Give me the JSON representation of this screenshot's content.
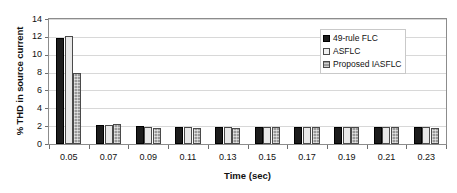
{
  "chart_data": {
    "type": "bar",
    "title": "",
    "xlabel": "Time (sec)",
    "ylabel": "% THD in source current",
    "categories": [
      "0.05",
      "0.07",
      "0.09",
      "0.11",
      "0.13",
      "0.15",
      "0.17",
      "0.19",
      "0.21",
      "0.23"
    ],
    "series": [
      {
        "name": "49-rule FLC",
        "color": "#1c1c1c",
        "values": [
          11.9,
          2.1,
          2.0,
          1.95,
          1.9,
          1.9,
          1.9,
          1.9,
          1.9,
          1.9
        ]
      },
      {
        "name": "ASFLC",
        "color": "#e8e8e8",
        "values": [
          12.05,
          2.1,
          1.95,
          1.9,
          1.9,
          1.9,
          1.9,
          1.9,
          1.9,
          1.85
        ]
      },
      {
        "name": "Proposed IASFLC",
        "color": "#9a9a9a",
        "values": [
          7.9,
          2.25,
          1.8,
          1.8,
          1.8,
          1.85,
          1.85,
          1.85,
          1.85,
          1.8
        ]
      }
    ],
    "ylim": [
      0,
      14
    ],
    "yticks": [
      0,
      2,
      4,
      6,
      8,
      10,
      12,
      14
    ],
    "ytick_labels": [
      "0",
      "2",
      "4",
      "6",
      "8",
      "10",
      "12",
      "14"
    ],
    "grid": true,
    "grid_axis": "y",
    "legend_position": "top-right"
  },
  "legend": {
    "items": [
      {
        "label": "49-rule FLC"
      },
      {
        "label": "ASFLC"
      },
      {
        "label": "Proposed IASFLC"
      }
    ]
  },
  "axes": {
    "x_title": "Time (sec)",
    "y_title": "% THD in source current"
  }
}
